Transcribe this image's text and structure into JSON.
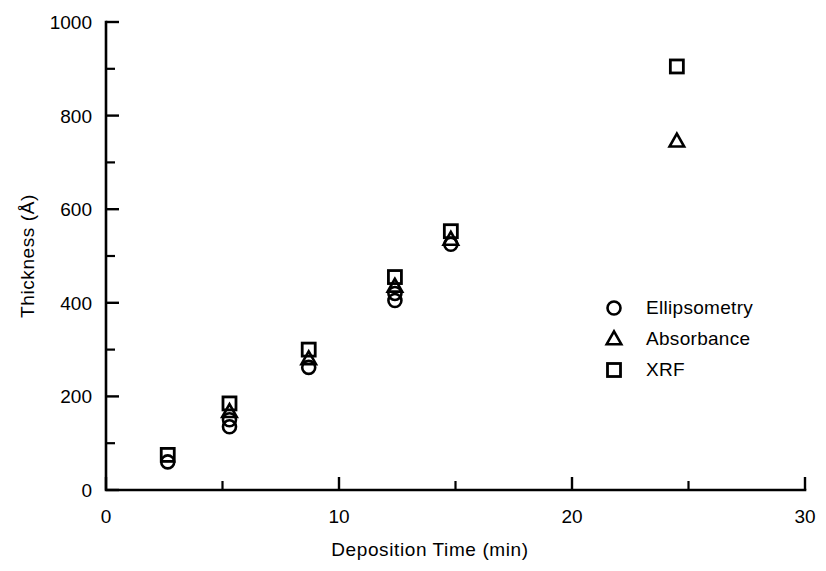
{
  "chart_data": {
    "type": "scatter",
    "title": "",
    "xlabel": "Deposition Time (min)",
    "ylabel": "Thickness (Å)",
    "xlim": [
      0,
      30
    ],
    "ylim": [
      0,
      1000
    ],
    "grid": false,
    "legend_position": "center-right",
    "x_ticks_major": [
      0,
      10,
      20,
      30
    ],
    "x_ticks_minor": [
      5,
      15,
      25
    ],
    "x_tick_labels": [
      "0",
      "10",
      "20",
      "30"
    ],
    "y_ticks_major": [
      0,
      200,
      400,
      600,
      800,
      1000
    ],
    "y_ticks_minor": [
      100,
      300,
      500,
      700,
      900
    ],
    "y_tick_labels": [
      "0",
      "200",
      "400",
      "600",
      "800",
      "1000"
    ],
    "series": [
      {
        "name": "Ellipsometry",
        "marker": "circle",
        "points": [
          {
            "x": 2.65,
            "y": 60
          },
          {
            "x": 5.3,
            "y": 150
          },
          {
            "x": 5.3,
            "y": 135
          },
          {
            "x": 8.7,
            "y": 262
          },
          {
            "x": 12.4,
            "y": 420
          },
          {
            "x": 12.4,
            "y": 405
          },
          {
            "x": 14.8,
            "y": 525
          }
        ]
      },
      {
        "name": "Absorbance",
        "marker": "triangle",
        "points": [
          {
            "x": 5.3,
            "y": 167
          },
          {
            "x": 8.7,
            "y": 280
          },
          {
            "x": 12.4,
            "y": 435
          },
          {
            "x": 14.8,
            "y": 535
          },
          {
            "x": 24.5,
            "y": 745
          }
        ]
      },
      {
        "name": "XRF",
        "marker": "square",
        "points": [
          {
            "x": 2.65,
            "y": 75
          },
          {
            "x": 5.3,
            "y": 185
          },
          {
            "x": 8.7,
            "y": 300
          },
          {
            "x": 12.4,
            "y": 455
          },
          {
            "x": 14.8,
            "y": 553
          },
          {
            "x": 24.5,
            "y": 905
          }
        ]
      }
    ]
  },
  "legend": {
    "entries": [
      {
        "marker": "circle",
        "label": "Ellipsometry"
      },
      {
        "marker": "triangle",
        "label": "Absorbance"
      },
      {
        "marker": "square",
        "label": "XRF"
      }
    ]
  },
  "colors": {
    "ink": "#000000",
    "background": "#ffffff"
  }
}
